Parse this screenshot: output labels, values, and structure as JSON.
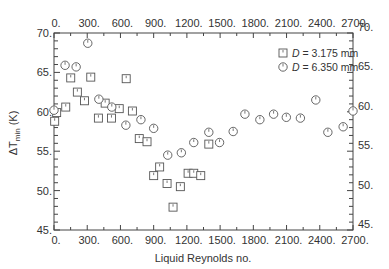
{
  "chart_data": {
    "type": "scatter",
    "title": "",
    "xlabel": "Liquid Reynolds no.",
    "ylabel": "ΔT",
    "ylabel_sub": "min",
    "ylabel_unit": " (K)",
    "xlim": [
      0,
      2700
    ],
    "ylim": [
      45,
      70
    ],
    "x_ticks": [
      0,
      300,
      600,
      900,
      1200,
      1500,
      1800,
      2100,
      2400,
      2700
    ],
    "x_tick_labels": [
      "0.",
      "300.",
      "600.",
      "900.",
      "1200.",
      "1500.",
      "1800.",
      "2100.",
      "2400.",
      "2700."
    ],
    "y_ticks": [
      45,
      50,
      55,
      60,
      65,
      70
    ],
    "y_tick_labels": [
      "45.",
      "50.",
      "55.",
      "60.",
      "65.",
      "70."
    ],
    "x_minor_step": 150,
    "y_minor_step": 1,
    "grid": false,
    "mirror_axes": true,
    "legend_position": "upper right",
    "series": [
      {
        "name": "D = 3.175 mm",
        "legend_var": "D",
        "legend_value": " = 3.175 mm",
        "marker": "square",
        "points": [
          [
            6,
            58.8
          ],
          [
            24,
            59.9
          ],
          [
            106,
            60.6
          ],
          [
            151,
            64.3
          ],
          [
            211,
            62.5
          ],
          [
            275,
            61.4
          ],
          [
            332,
            64.4
          ],
          [
            401,
            59.2
          ],
          [
            462,
            61.1
          ],
          [
            519,
            59.2
          ],
          [
            589,
            60.4
          ],
          [
            652,
            64.2
          ],
          [
            708,
            60.1
          ],
          [
            770,
            56.6
          ],
          [
            840,
            56.2
          ],
          [
            900,
            51.9
          ],
          [
            954,
            53.0
          ],
          [
            1021,
            50.9
          ],
          [
            1075,
            47.9
          ],
          [
            1141,
            50.5
          ],
          [
            1211,
            52.2
          ],
          [
            1262,
            52.2
          ],
          [
            1325,
            51.9
          ],
          [
            1398,
            55.9
          ]
        ]
      },
      {
        "name": "D = 6.350 mm",
        "legend_var": "D",
        "legend_value": " = 6.350 mm",
        "marker": "circle",
        "points": [
          [
            0,
            60.2
          ],
          [
            100,
            65.9
          ],
          [
            200,
            65.7
          ],
          [
            305,
            68.7
          ],
          [
            405,
            61.6
          ],
          [
            522,
            60.6
          ],
          [
            649,
            58.3
          ],
          [
            785,
            59.0
          ],
          [
            900,
            57.9
          ],
          [
            1027,
            54.5
          ],
          [
            1150,
            54.8
          ],
          [
            1262,
            56.1
          ],
          [
            1398,
            57.4
          ],
          [
            1495,
            56.1
          ],
          [
            1618,
            57.5
          ],
          [
            1724,
            59.7
          ],
          [
            1859,
            59.0
          ],
          [
            1983,
            59.7
          ],
          [
            2098,
            59.3
          ],
          [
            2225,
            59.2
          ],
          [
            2364,
            61.5
          ],
          [
            2473,
            57.4
          ],
          [
            2611,
            58.1
          ],
          [
            2700,
            60.1
          ]
        ]
      }
    ]
  }
}
